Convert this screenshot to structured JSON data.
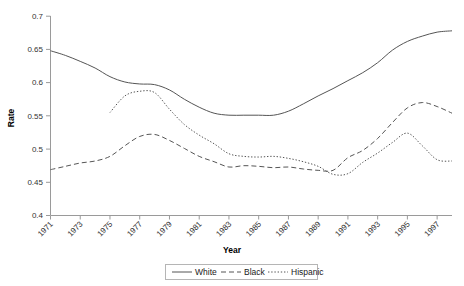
{
  "chart_data": {
    "type": "line",
    "title": "",
    "xlabel": "Year",
    "ylabel": "Rate",
    "grid": false,
    "legend_position": "bottom",
    "xlim": [
      1971,
      1998
    ],
    "ylim": [
      0.4,
      0.7
    ],
    "ytick_labels": [
      "0.4",
      "0.45",
      "0.5",
      "0.55",
      "0.6",
      "0.65",
      "0.7"
    ],
    "ytick_values": [
      0.4,
      0.45,
      0.5,
      0.55,
      0.6,
      0.65,
      0.7
    ],
    "xtick_labels": [
      "1971",
      "1973",
      "1975",
      "1977",
      "1979",
      "1981",
      "1983",
      "1985",
      "1987",
      "1989",
      "1991",
      "1993",
      "1995",
      "1997"
    ],
    "xtick_values": [
      1971,
      1973,
      1975,
      1977,
      1979,
      1981,
      1983,
      1985,
      1987,
      1989,
      1991,
      1993,
      1995,
      1997
    ],
    "x": [
      1971,
      1972,
      1973,
      1974,
      1975,
      1976,
      1977,
      1978,
      1979,
      1980,
      1981,
      1982,
      1983,
      1984,
      1985,
      1986,
      1987,
      1988,
      1989,
      1990,
      1991,
      1992,
      1993,
      1994,
      1995,
      1996,
      1997,
      1998
    ],
    "series": [
      {
        "name": "White",
        "style": "solid",
        "x": [
          1971,
          1972,
          1973,
          1974,
          1975,
          1976,
          1977,
          1978,
          1979,
          1980,
          1981,
          1982,
          1983,
          1984,
          1985,
          1986,
          1987,
          1988,
          1989,
          1990,
          1991,
          1992,
          1993,
          1994,
          1995,
          1996,
          1997,
          1998
        ],
        "values": [
          0.648,
          0.641,
          0.632,
          0.622,
          0.609,
          0.601,
          0.598,
          0.597,
          0.589,
          0.575,
          0.563,
          0.554,
          0.551,
          0.551,
          0.551,
          0.551,
          0.557,
          0.568,
          0.58,
          0.591,
          0.603,
          0.615,
          0.63,
          0.649,
          0.662,
          0.67,
          0.676,
          0.678
        ]
      },
      {
        "name": "Black",
        "style": "dashed",
        "x": [
          1971,
          1972,
          1973,
          1974,
          1975,
          1976,
          1977,
          1978,
          1979,
          1980,
          1981,
          1982,
          1983,
          1984,
          1985,
          1986,
          1987,
          1988,
          1989,
          1990,
          1991,
          1992,
          1993,
          1994,
          1995,
          1996,
          1997,
          1998
        ],
        "values": [
          0.469,
          0.474,
          0.479,
          0.482,
          0.489,
          0.505,
          0.519,
          0.522,
          0.513,
          0.501,
          0.489,
          0.481,
          0.473,
          0.475,
          0.474,
          0.472,
          0.473,
          0.47,
          0.468,
          0.468,
          0.487,
          0.498,
          0.516,
          0.54,
          0.562,
          0.57,
          0.564,
          0.554
        ]
      },
      {
        "name": "Hispanic",
        "style": "dotted",
        "x": [
          1975,
          1976,
          1977,
          1978,
          1979,
          1980,
          1981,
          1982,
          1983,
          1984,
          1985,
          1986,
          1987,
          1988,
          1989,
          1990,
          1991,
          1992,
          1993,
          1994,
          1995,
          1996,
          1997,
          1998
        ],
        "values": [
          0.555,
          0.58,
          0.587,
          0.585,
          0.56,
          0.537,
          0.521,
          0.508,
          0.493,
          0.489,
          0.488,
          0.489,
          0.486,
          0.481,
          0.474,
          0.462,
          0.463,
          0.48,
          0.494,
          0.51,
          0.524,
          0.505,
          0.484,
          0.482
        ]
      }
    ],
    "legend": [
      {
        "label": "White",
        "style": "solid"
      },
      {
        "label": "Black",
        "style": "dashed"
      },
      {
        "label": "Hispanic",
        "style": "dotted"
      }
    ],
    "colors": {
      "line": "#555555",
      "axis": "#9a9a9a",
      "text": "#333333",
      "background": "#ffffff"
    }
  }
}
